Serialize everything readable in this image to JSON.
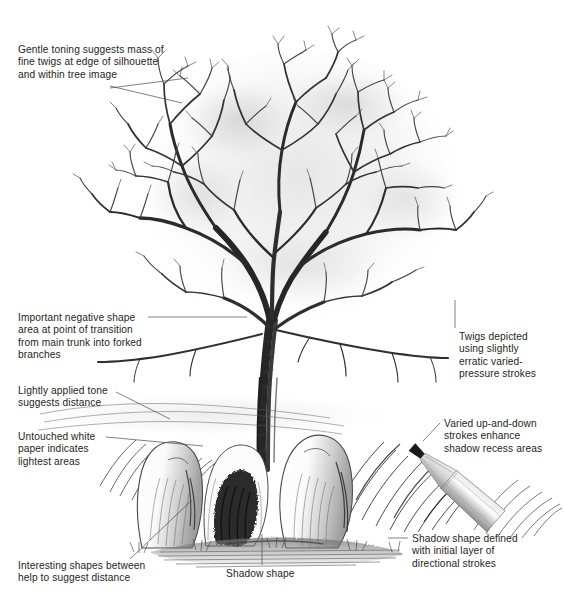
{
  "figure": {
    "background_color": "#ffffff",
    "ink_color": "#231f20",
    "leader_line_color": "#4a4a4a"
  },
  "annotations": [
    {
      "id": "gentle-toning",
      "text": "Gentle toning suggests mass of\nfine twigs at edge of silhouette\nand within tree image",
      "x": 18,
      "y": 44,
      "leaders": [
        {
          "x1": 110,
          "y1": 86,
          "x2": 182,
          "y2": 103
        },
        {
          "x1": 110,
          "y1": 88,
          "x2": 188,
          "y2": 78
        }
      ]
    },
    {
      "id": "negative-shape",
      "text": "Important negative shape\narea at point of transition\nfrom main trunk into forked\nbranches",
      "x": 18,
      "y": 312,
      "leaders": [
        {
          "x1": 148,
          "y1": 317,
          "x2": 247,
          "y2": 317
        }
      ]
    },
    {
      "id": "lightly-applied-tone",
      "text": "Lightly applied tone\nsuggests distance",
      "x": 18,
      "y": 385,
      "leaders": [
        {
          "x1": 116,
          "y1": 392,
          "x2": 170,
          "y2": 419
        }
      ]
    },
    {
      "id": "untouched-white-paper",
      "text": "Untouched white\npaper indicates\nlightest areas",
      "x": 18,
      "y": 431,
      "leaders": [
        {
          "x1": 106,
          "y1": 437,
          "x2": 203,
          "y2": 446
        }
      ]
    },
    {
      "id": "interesting-shapes",
      "text": "Interesting shapes between\nhelp to suggest distance",
      "x": 18,
      "y": 560,
      "leaders": [
        {
          "x1": 130,
          "y1": 559,
          "x2": 192,
          "y2": 500
        }
      ]
    },
    {
      "id": "shadow-shape",
      "text": "Shadow shape",
      "x": 226,
      "y": 568,
      "leaders": [
        {
          "x1": 262,
          "y1": 565,
          "x2": 262,
          "y2": 534
        }
      ]
    },
    {
      "id": "twigs-depicted",
      "text": "Twigs depicted\nusing slightly\nerratic varied-\npressure strokes",
      "x": 459,
      "y": 331,
      "leaders": [
        {
          "x1": 455,
          "y1": 328,
          "x2": 455,
          "y2": 300
        }
      ]
    },
    {
      "id": "varied-up-and-down-strokes",
      "text": "Varied up-and-down\nstrokes enhance\nshadow recess areas",
      "x": 444,
      "y": 418,
      "leaders": [
        {
          "x1": 440,
          "y1": 423,
          "x2": 423,
          "y2": 441
        }
      ]
    },
    {
      "id": "shadow-shape-defined",
      "text": "Shadow shape defined\nwith initial layer of\ndirectional strokes",
      "x": 412,
      "y": 533,
      "leaders": [
        {
          "x1": 408,
          "y1": 538,
          "x2": 388,
          "y2": 538
        }
      ]
    }
  ],
  "drawn_pencil": {
    "id": "pencil-illustration",
    "description": "Graphite pencil drawn diagonally with its sharpened tip pointing up and to the left",
    "tip_x": 412,
    "tip_y": 447,
    "tail_x": 492,
    "tail_y": 518
  }
}
